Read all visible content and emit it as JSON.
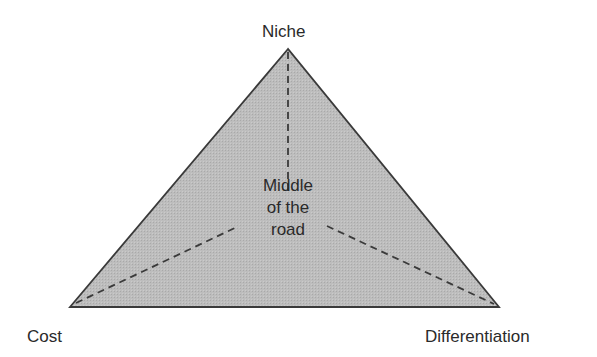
{
  "diagram": {
    "type": "strategy-triangle",
    "vertices": {
      "top": {
        "label": "Niche",
        "x": 288,
        "y": 49
      },
      "bottom_left": {
        "label": "Cost",
        "x": 70,
        "y": 307
      },
      "bottom_right": {
        "label": "Differentiation",
        "x": 499,
        "y": 307
      }
    },
    "center": {
      "lines": [
        "Middle",
        "of the",
        "road"
      ]
    },
    "colors": {
      "fill": "#b9b9b9",
      "stroke": "#3a3a3a",
      "dashed": "#3a3a3a",
      "text": "#2a2a2a"
    }
  }
}
